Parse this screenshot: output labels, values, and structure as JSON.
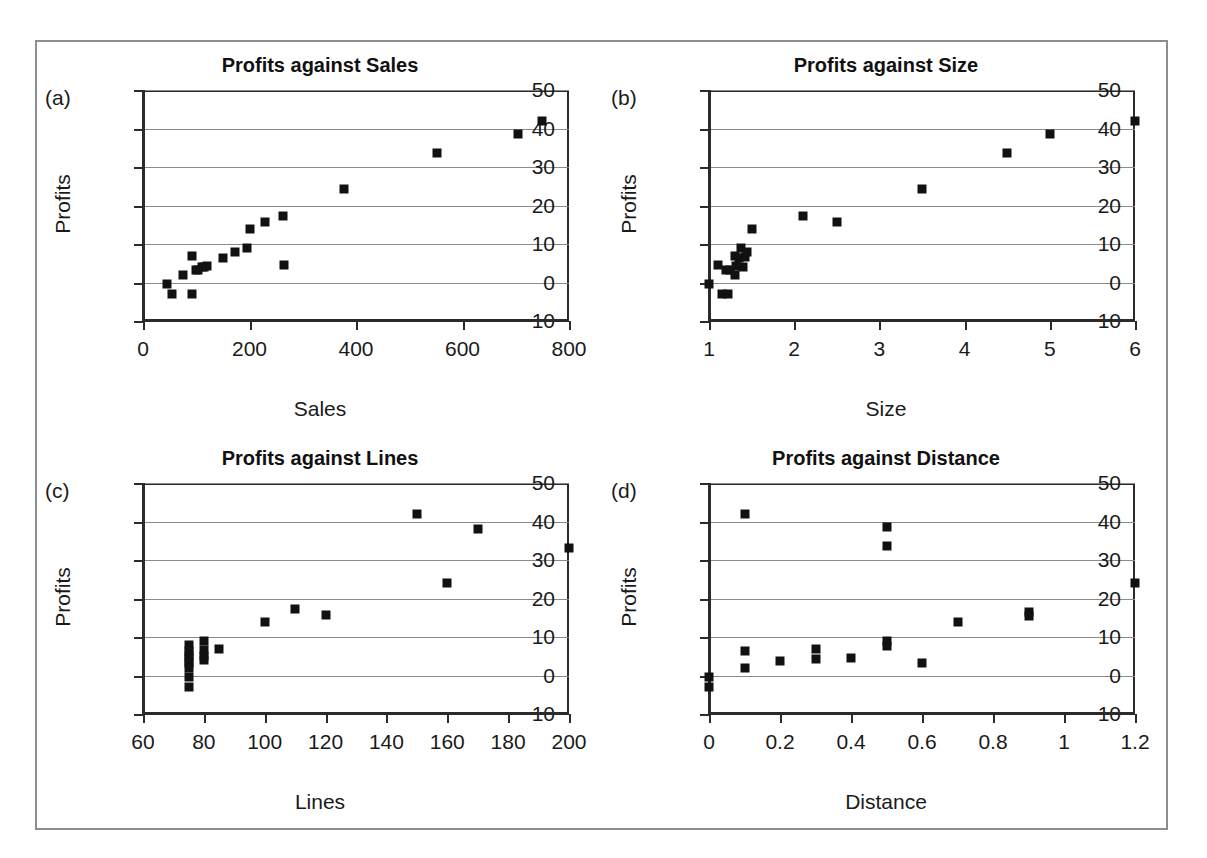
{
  "figure": {
    "background": "#ffffff",
    "frame_color": "#8d8d8d",
    "marker_color": "#111111",
    "grid_color": "#8a8a8a",
    "axis_color": "#2b2b2b"
  },
  "panels": [
    {
      "tag": "(a)",
      "title": "Profits against Sales",
      "xlabel": "Sales",
      "ylabel": "Profits"
    },
    {
      "tag": "(b)",
      "title": "Profits against Size",
      "xlabel": "Size",
      "ylabel": "Profits"
    },
    {
      "tag": "(c)",
      "title": "Profits against Lines",
      "xlabel": "Lines",
      "ylabel": "Profits"
    },
    {
      "tag": "(d)",
      "title": "Profits against Distance",
      "xlabel": "Distance",
      "ylabel": "Profits"
    }
  ],
  "chart_data": [
    {
      "type": "scatter",
      "panel": "(a)",
      "title": "Profits against Sales",
      "xlabel": "Sales",
      "ylabel": "Profits",
      "xlim": [
        0,
        800
      ],
      "ylim": [
        -10,
        50
      ],
      "xticks": [
        0,
        200,
        400,
        600,
        800
      ],
      "xtick_labels": [
        "0",
        "200",
        "400",
        "600",
        "800"
      ],
      "yticks": [
        -10,
        0,
        10,
        20,
        30,
        40,
        50
      ],
      "ytick_labels": [
        "−10",
        "0",
        "10",
        "20",
        "30",
        "40",
        "50"
      ],
      "grid": "horizontal",
      "legend": "none",
      "x": [
        45,
        55,
        75,
        92,
        92,
        100,
        103,
        110,
        115,
        120,
        150,
        172,
        195,
        200,
        230,
        262,
        265,
        378,
        552,
        705,
        750
      ],
      "y": [
        -0.4,
        -3.0,
        2.0,
        7.0,
        -3.0,
        3.2,
        3.3,
        4.0,
        4.1,
        4.2,
        6.4,
        7.8,
        9.0,
        13.9,
        15.6,
        17.3,
        4.5,
        24.2,
        33.6,
        38.5,
        42.0
      ]
    },
    {
      "type": "scatter",
      "panel": "(b)",
      "title": "Profits against Size",
      "xlabel": "Size",
      "ylabel": "Profits",
      "xlim": [
        1,
        6
      ],
      "ylim": [
        -10,
        50
      ],
      "xticks": [
        1,
        2,
        3,
        4,
        5,
        6
      ],
      "xtick_labels": [
        "1",
        "2",
        "3",
        "4",
        "5",
        "6"
      ],
      "yticks": [
        -10,
        0,
        10,
        20,
        30,
        40,
        50
      ],
      "ytick_labels": [
        "−10",
        "0",
        "10",
        "20",
        "30",
        "40",
        "50"
      ],
      "grid": "horizontal",
      "legend": "none",
      "x": [
        1.0,
        1.1,
        1.15,
        1.2,
        1.22,
        1.25,
        1.3,
        1.3,
        1.32,
        1.35,
        1.38,
        1.4,
        1.42,
        1.45,
        1.5,
        2.1,
        2.5,
        3.5,
        4.5,
        5.0,
        6.0
      ],
      "y": [
        -0.4,
        4.5,
        -3.0,
        3.2,
        -3.0,
        3.3,
        7.0,
        2.0,
        4.2,
        6.4,
        9.0,
        4.1,
        6.5,
        7.8,
        13.9,
        17.4,
        15.6,
        24.2,
        33.6,
        38.5,
        42.0
      ]
    },
    {
      "type": "scatter",
      "panel": "(c)",
      "title": "Profits against Lines",
      "xlabel": "Lines",
      "ylabel": "Profits",
      "xlim": [
        60,
        200
      ],
      "ylim": [
        -10,
        50
      ],
      "xticks": [
        60,
        80,
        100,
        120,
        140,
        160,
        180,
        200
      ],
      "xtick_labels": [
        "60",
        "80",
        "100",
        "120",
        "140",
        "160",
        "180",
        "200"
      ],
      "yticks": [
        -10,
        0,
        10,
        20,
        30,
        40,
        50
      ],
      "ytick_labels": [
        "−10",
        "0",
        "10",
        "20",
        "30",
        "40",
        "50"
      ],
      "grid": "horizontal",
      "legend": "none",
      "x": [
        75,
        75,
        75,
        75,
        75,
        75,
        75,
        75,
        80,
        80,
        80,
        80,
        85,
        100,
        110,
        120,
        150,
        160,
        170,
        200
      ],
      "y": [
        7.8,
        6.4,
        5.2,
        4.2,
        3.3,
        2.0,
        -0.4,
        -3.0,
        9.0,
        6.5,
        5.0,
        4.1,
        7.0,
        13.9,
        17.3,
        15.6,
        42.0,
        24.0,
        38.0,
        33.0
      ]
    },
    {
      "type": "scatter",
      "panel": "(d)",
      "title": "Profits against Distance",
      "xlabel": "Distance",
      "ylabel": "Profits",
      "xlim": [
        0,
        1.2
      ],
      "ylim": [
        -10,
        50
      ],
      "xticks": [
        0,
        0.2,
        0.4,
        0.6,
        0.8,
        1.0,
        1.2
      ],
      "xtick_labels": [
        "0",
        "0.2",
        "0.4",
        "0.6",
        "0.8",
        "1",
        "1.2"
      ],
      "yticks": [
        -10,
        0,
        10,
        20,
        30,
        40,
        50
      ],
      "ytick_labels": [
        "−10",
        "0",
        "10",
        "20",
        "30",
        "40",
        "50"
      ],
      "grid": "horizontal",
      "legend": "none",
      "x": [
        0.0,
        0.0,
        0.1,
        0.1,
        0.1,
        0.2,
        0.3,
        0.3,
        0.4,
        0.5,
        0.5,
        0.5,
        0.5,
        0.6,
        0.7,
        0.9,
        0.9,
        1.2
      ],
      "y": [
        -0.4,
        -3.0,
        42.0,
        6.4,
        2.0,
        3.8,
        7.0,
        4.2,
        4.5,
        38.5,
        33.6,
        9.0,
        7.6,
        3.3,
        13.9,
        16.6,
        15.4,
        24.0
      ]
    }
  ]
}
